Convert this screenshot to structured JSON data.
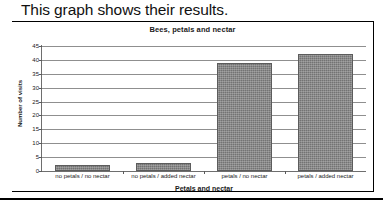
{
  "page": {
    "heading": "This graph shows their results."
  },
  "colors": {
    "bar_fill": "#737373",
    "bar_border": "#5c5c5c",
    "gridline": "#8f8f8f",
    "axis": "#6e6e6e",
    "frame": "#000000",
    "text": "#1a1a1a",
    "background": "#ffffff"
  },
  "chart_data": {
    "type": "bar",
    "title": "Bees, petals and nectar",
    "xlabel": "Petals and nectar",
    "ylabel": "Number of visits",
    "categories": [
      "no petals / no nectar",
      "no petals / added nectar",
      "petals / no nectar",
      "petals / added nectar"
    ],
    "values": [
      2,
      3,
      39,
      42
    ],
    "ylim": [
      0,
      45
    ],
    "ytick_labels": [
      "0",
      "5",
      "10",
      "15",
      "20",
      "25",
      "30",
      "35",
      "40",
      "45"
    ],
    "ytick_values": [
      0,
      5,
      10,
      15,
      20,
      25,
      30,
      35,
      40,
      45
    ],
    "ytick_step": 5,
    "grid": true,
    "legend": false,
    "series": [
      {
        "name": "Number of visits",
        "values": [
          2,
          3,
          39,
          42
        ]
      }
    ]
  }
}
